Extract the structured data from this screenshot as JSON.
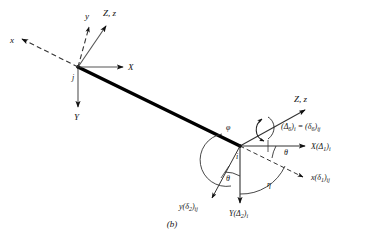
{
  "figure": {
    "caption": "(b)",
    "type": "structural-beam-element-axes-diagram"
  },
  "global_axes_at_j": {
    "node_label": "j",
    "x_axis_label": "X",
    "y_axis_label": "Y",
    "z_axis_label": "Z, z"
  },
  "local_axes_at_j": {
    "x_axis_label": "x",
    "y_axis_label": "y"
  },
  "node_i": {
    "node_label": "i",
    "z_axis_label": "Z, z",
    "torsion_label_part1": "(Δ",
    "torsion_label_sub1": "6",
    "torsion_label_part2": ")",
    "torsion_label_sub2": "i",
    "torsion_label_eq": " = (δ",
    "torsion_label_sub3": "6",
    "torsion_label_part3": ")",
    "torsion_label_sub4": "ij",
    "torsion_label_full": "(Δ6)i = (δ6)ij",
    "global_x_label_main": "X(Δ",
    "global_x_label_sub": "1",
    "global_x_label_close": ")",
    "global_x_label_subi": "i",
    "global_x_label_full": "X(Δ1)i",
    "local_x_label_main": "x(δ",
    "local_x_label_sub": "1",
    "local_x_label_close": ")",
    "local_x_label_subij": "ij",
    "local_x_label_full": "x(δ1)ij",
    "global_y_label_main": "Y(Δ",
    "global_y_label_sub": "2",
    "global_y_label_close": ")",
    "global_y_label_subi": "i",
    "global_y_label_full": "Y(Δ2)i",
    "local_y_label_main": "y(δ",
    "local_y_label_sub": "2",
    "local_y_label_close": ")",
    "local_y_label_subij": "ij",
    "local_y_label_full": "y(δ2)ij"
  },
  "angles": {
    "phi": "φ",
    "theta_upper": "θ",
    "theta_lower": "θ",
    "eta": "η"
  },
  "colors": {
    "ink": "#111111",
    "member": "#000000",
    "background": "#ffffff"
  }
}
